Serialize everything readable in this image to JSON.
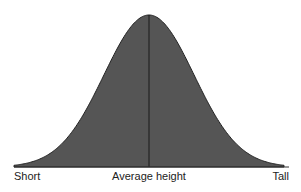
{
  "chart_data": {
    "type": "area",
    "title": "",
    "xlabel": "",
    "ylabel": "",
    "distribution": "normal",
    "x_tick_labels": [
      "Short",
      "Average height",
      "Tall"
    ],
    "x": [
      -3,
      -2.5,
      -2,
      -1.5,
      -1,
      -0.5,
      0,
      0.5,
      1,
      1.5,
      2,
      2.5,
      3
    ],
    "values": [
      0.011,
      0.044,
      0.135,
      0.325,
      0.607,
      0.882,
      1.0,
      0.882,
      0.607,
      0.325,
      0.135,
      0.044,
      0.011
    ],
    "mean_line": true,
    "grid": false,
    "legend": false,
    "colors": {
      "fill": "#555555",
      "stroke": "#222222",
      "mean_line": "#1a1a1a"
    }
  },
  "labels": {
    "left": "Short",
    "center": "Average height",
    "right": "Tall"
  }
}
